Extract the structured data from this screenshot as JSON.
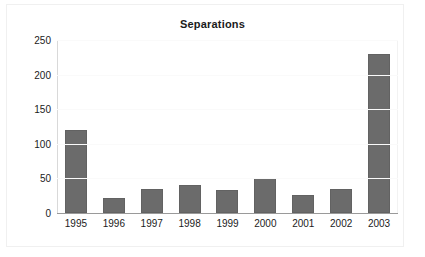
{
  "chart_data": {
    "type": "bar",
    "title": "Separations",
    "xlabel": "",
    "ylabel": "",
    "categories": [
      "1995",
      "1996",
      "1997",
      "1998",
      "1999",
      "2000",
      "2001",
      "2002",
      "2003"
    ],
    "values": [
      120,
      21,
      34,
      41,
      33,
      50,
      26,
      35,
      230
    ],
    "series": [
      {
        "name": "Separations",
        "values": [
          120,
          21,
          34,
          41,
          33,
          50,
          26,
          35,
          230
        ]
      }
    ],
    "ylim": [
      0,
      250
    ],
    "y_ticks": [
      "0",
      "50",
      "100",
      "150",
      "200",
      "250"
    ],
    "y_tick_values": [
      0,
      50,
      100,
      150,
      200,
      250
    ],
    "grid": false,
    "legend": false,
    "legend_position": "none",
    "bar_color": "#6b6b6b",
    "bar_border_color": "#626262",
    "text_color": "#1b1b1b",
    "background_color": "#ffffff",
    "axis_line_color": "#9a9a9a"
  }
}
